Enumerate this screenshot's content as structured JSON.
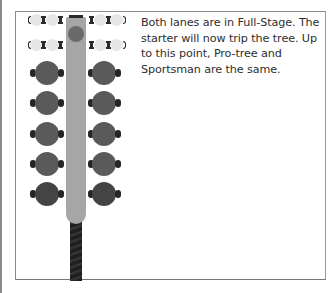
{
  "instructions": {
    "text": "Both lanes are in Full-Stage. The starter will now trip the tree. Up to this point, Pro-tree and Sportsman are the same."
  },
  "tree": {
    "stage_rows": [
      {
        "name": "pre-stage",
        "state": "lit"
      },
      {
        "name": "stage",
        "state": "lit"
      }
    ],
    "bulb_rows": [
      {
        "name": "amber-1",
        "state": "off"
      },
      {
        "name": "amber-2",
        "state": "off"
      },
      {
        "name": "amber-3",
        "state": "off"
      },
      {
        "name": "green",
        "state": "off"
      },
      {
        "name": "red",
        "state": "off"
      }
    ]
  },
  "colors": {
    "pole": "#a6a6a6",
    "bulb": "#5a5a5a",
    "red_bulb": "#444444",
    "stage_bulb": "#e6e6e6",
    "text": "#2e2e2e"
  }
}
